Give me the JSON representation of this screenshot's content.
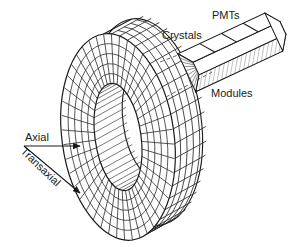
{
  "figure": {
    "name": "pet-scanner-detector-ring-diagram",
    "background": "#ffffff",
    "ink": "#1a1a1a",
    "shade": "#9a9a9a",
    "width": 292,
    "height": 247
  },
  "labels": {
    "pmts": "PMTs",
    "crystals": "Crystals",
    "modules": "Modules",
    "axial": "Axial",
    "transaxial": "Transaxial"
  },
  "ring": {
    "name": "detector-ring",
    "center_x": 118,
    "center_y": 137,
    "outer_rx": 55,
    "outer_ry": 104,
    "inner_rx": 23,
    "inner_ry": 54,
    "depth_x": 34,
    "depth_y": -13,
    "circumferential_divisions": 44,
    "axial_divisions": 5,
    "tilt_deg": -8
  },
  "module": {
    "name": "detector-module-block",
    "pmt_segments": 4,
    "crystal_striations": 9,
    "origin_x": 196,
    "origin_y": 62,
    "length": 96,
    "width": 26,
    "height": 15,
    "rotation_deg": -25,
    "bottom_face_shaded": true
  },
  "leaders": {
    "name": "dashed-callout-lines",
    "count": 2,
    "style": "dashed",
    "dash": "4 3"
  },
  "axes": {
    "axial_arrow": {
      "x1": 24,
      "y1": 146,
      "x2": 84,
      "y2": 146
    },
    "transaxial_arrow": {
      "x1": 24,
      "y1": 146,
      "x2": 84,
      "y2": 196
    },
    "transaxial_text_rotation_deg": 44
  }
}
